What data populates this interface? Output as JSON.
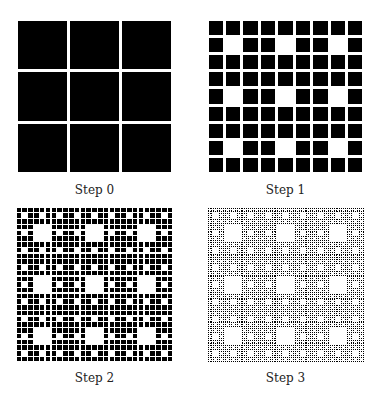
{
  "colors": {
    "fill": "#000000",
    "background": "#ffffff"
  },
  "panels": [
    {
      "label": "Step 0",
      "step": 0,
      "left": 16,
      "top": 19
    },
    {
      "label": "Step 1",
      "step": 1,
      "left": 207,
      "top": 19
    },
    {
      "label": "Step 2",
      "step": 2,
      "left": 16,
      "top": 207
    },
    {
      "label": "Step 3",
      "step": 3,
      "left": 207,
      "top": 207
    }
  ],
  "grid": {
    "size": 157,
    "height": 155
  }
}
